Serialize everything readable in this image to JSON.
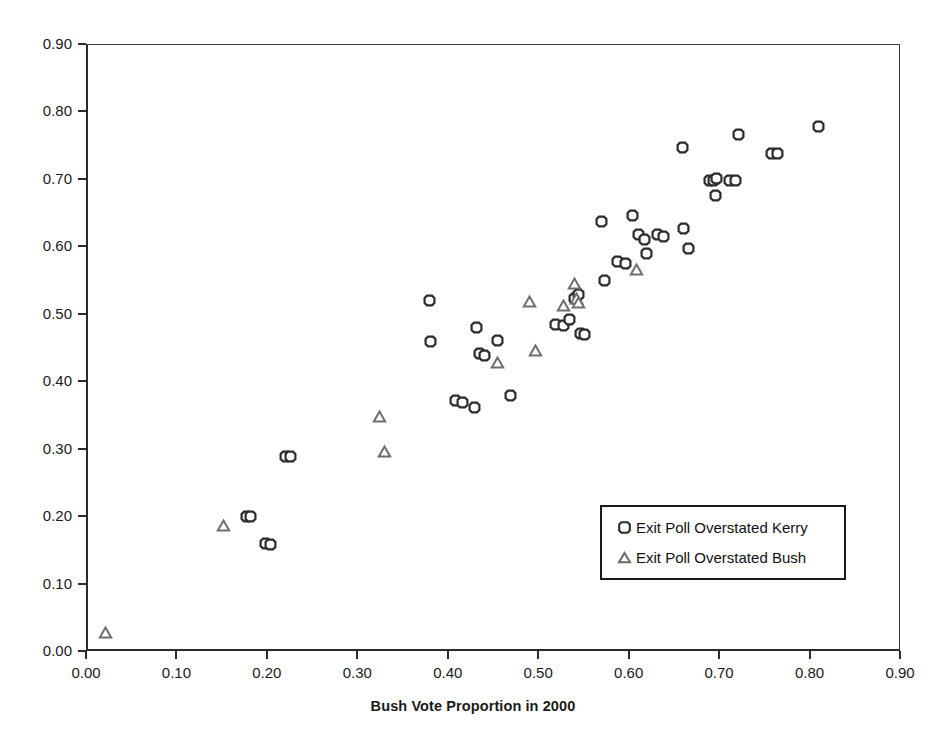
{
  "chart_data": {
    "type": "scatter",
    "title": "",
    "xlabel": "Bush Vote Proportion in 2000",
    "ylabel": "",
    "xlim": [
      0.0,
      0.9
    ],
    "ylim": [
      0.0,
      0.9
    ],
    "xticks": [
      "0.00",
      "0.10",
      "0.20",
      "0.30",
      "0.40",
      "0.50",
      "0.60",
      "0.70",
      "0.80",
      "0.90"
    ],
    "yticks": [
      "0.00",
      "0.10",
      "0.20",
      "0.30",
      "0.40",
      "0.50",
      "0.60",
      "0.70",
      "0.80",
      "0.90"
    ],
    "xtick_values": [
      0.0,
      0.1,
      0.2,
      0.3,
      0.4,
      0.5,
      0.6,
      0.7,
      0.8,
      0.9
    ],
    "ytick_values": [
      0.0,
      0.1,
      0.2,
      0.3,
      0.4,
      0.5,
      0.6,
      0.7,
      0.8,
      0.9
    ],
    "grid": false,
    "legend_position": "inside-lower-right",
    "series": [
      {
        "name": "Exit Poll Overstated Kerry",
        "marker": "circle",
        "color": "#2b2b2b",
        "points": [
          [
            0.178,
            0.199
          ],
          [
            0.182,
            0.199
          ],
          [
            0.199,
            0.159
          ],
          [
            0.204,
            0.158
          ],
          [
            0.221,
            0.289
          ],
          [
            0.226,
            0.289
          ],
          [
            0.38,
            0.519
          ],
          [
            0.381,
            0.459
          ],
          [
            0.409,
            0.371
          ],
          [
            0.416,
            0.368
          ],
          [
            0.429,
            0.361
          ],
          [
            0.432,
            0.48
          ],
          [
            0.435,
            0.441
          ],
          [
            0.441,
            0.438
          ],
          [
            0.455,
            0.46
          ],
          [
            0.469,
            0.379
          ],
          [
            0.519,
            0.484
          ],
          [
            0.528,
            0.482
          ],
          [
            0.535,
            0.491
          ],
          [
            0.54,
            0.522
          ],
          [
            0.544,
            0.528
          ],
          [
            0.547,
            0.471
          ],
          [
            0.551,
            0.469
          ],
          [
            0.57,
            0.637
          ],
          [
            0.573,
            0.55
          ],
          [
            0.588,
            0.578
          ],
          [
            0.597,
            0.575
          ],
          [
            0.604,
            0.645
          ],
          [
            0.611,
            0.617
          ],
          [
            0.617,
            0.61
          ],
          [
            0.62,
            0.59
          ],
          [
            0.632,
            0.617
          ],
          [
            0.638,
            0.614
          ],
          [
            0.659,
            0.746
          ],
          [
            0.661,
            0.627
          ],
          [
            0.666,
            0.597
          ],
          [
            0.689,
            0.698
          ],
          [
            0.694,
            0.697
          ],
          [
            0.696,
            0.675
          ],
          [
            0.697,
            0.7
          ],
          [
            0.712,
            0.698
          ],
          [
            0.718,
            0.698
          ],
          [
            0.721,
            0.766
          ],
          [
            0.758,
            0.737
          ],
          [
            0.765,
            0.737
          ],
          [
            0.81,
            0.777
          ]
        ]
      },
      {
        "name": "Exit Poll Overstated Bush",
        "marker": "triangle",
        "color": "#6e6e6e",
        "points": [
          [
            0.022,
            0.027
          ],
          [
            0.152,
            0.186
          ],
          [
            0.325,
            0.348
          ],
          [
            0.33,
            0.296
          ],
          [
            0.455,
            0.428
          ],
          [
            0.49,
            0.518
          ],
          [
            0.497,
            0.445
          ],
          [
            0.528,
            0.512
          ],
          [
            0.54,
            0.545
          ],
          [
            0.542,
            0.522
          ],
          [
            0.545,
            0.516
          ],
          [
            0.609,
            0.566
          ]
        ]
      }
    ]
  },
  "legend": {
    "items": [
      {
        "label": "Exit Poll Overstated Kerry",
        "marker": "circle"
      },
      {
        "label": "Exit Poll Overstated Bush",
        "marker": "triangle"
      }
    ]
  },
  "colors": {
    "circle_marker": "#2b2b2b",
    "triangle_marker": "#6e6e6e",
    "axis": "#2b2b2b",
    "background": "#ffffff"
  }
}
